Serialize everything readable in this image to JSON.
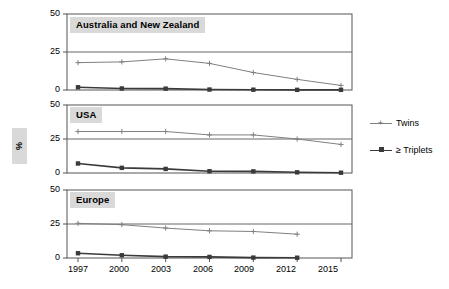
{
  "chart_data": {
    "type": "line",
    "title": "",
    "xlabel": "",
    "ylabel": "%",
    "x": [
      1997,
      2000,
      2003,
      2006,
      2009,
      2012,
      2015
    ],
    "xtick_labels": [
      "1997",
      "2000",
      "2003",
      "2006",
      "2009",
      "2012",
      "2015"
    ],
    "ytick_labels": [
      "0",
      "25",
      "50"
    ],
    "yticks": [
      0,
      25,
      50
    ],
    "ylim": [
      0,
      50
    ],
    "grid": true,
    "legend_position": "right",
    "panels": [
      {
        "name": "Australia and New Zealand",
        "series": [
          {
            "name": "Twins",
            "values": [
              18,
              18.5,
              20.5,
              17.5,
              11.5,
              7,
              3
            ]
          },
          {
            "name": "≥ Triplets",
            "values": [
              1.8,
              1,
              0.9,
              0.3,
              0.2,
              0.1,
              0.1
            ]
          }
        ]
      },
      {
        "name": "USA",
        "series": [
          {
            "name": "Twins",
            "values": [
              30.5,
              30.5,
              30.5,
              28,
              28,
              25,
              21
            ]
          },
          {
            "name": "≥ Triplets",
            "values": [
              7,
              3.8,
              3,
              1.3,
              1.2,
              0.5,
              0.2
            ]
          }
        ]
      },
      {
        "name": "Europe",
        "series": [
          {
            "name": "Twins",
            "values": [
              25.5,
              24.5,
              22,
              20,
              19.5,
              17.5,
              null
            ]
          },
          {
            "name": "≥ Triplets",
            "values": [
              3.5,
              2,
              1,
              0.8,
              0.3,
              0.2,
              null
            ]
          }
        ]
      }
    ],
    "legend": [
      {
        "label": "Twins",
        "color": "#808080",
        "marker": "plus"
      },
      {
        "label": "≥ Triplets",
        "color": "#3a3a3a",
        "marker": "square"
      }
    ],
    "colors": {
      "twins": "#808080",
      "triplets": "#3a3a3a",
      "axis": "#555555",
      "grid": "#666666",
      "panel_title_bg": "#d9d9d9",
      "background": "#ffffff"
    }
  }
}
